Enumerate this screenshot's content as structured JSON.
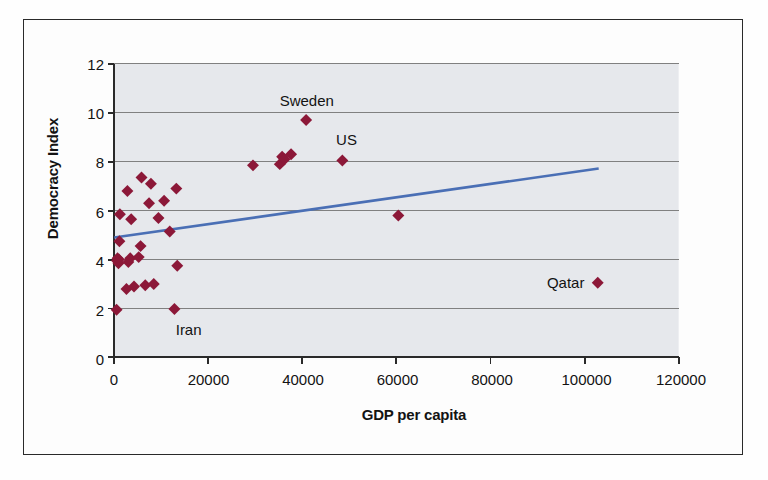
{
  "figure": {
    "name": "democracy-index-vs-gdp-scatter",
    "border_color": "#2a2a2a",
    "background": "#fdfdfd"
  },
  "chart_data": {
    "type": "scatter",
    "title": "",
    "subtitle": "",
    "xlabel": "GDP per capita",
    "ylabel": "Democracy Index",
    "xlim": [
      0,
      120000
    ],
    "ylim": [
      0,
      12
    ],
    "xticks": [
      0,
      20000,
      40000,
      60000,
      80000,
      100000,
      120000
    ],
    "xtick_labels": [
      "0",
      "20000",
      "40000",
      "60000",
      "80000",
      "100000",
      "120000"
    ],
    "yticks": [
      0,
      2,
      4,
      6,
      8,
      10,
      12
    ],
    "ytick_labels": [
      "0",
      "2",
      "4",
      "6",
      "8",
      "10",
      "12"
    ],
    "grid": "horizontal",
    "grid_color": "#808080",
    "plot_background": "#e6e8ec",
    "legend": "none",
    "marker": {
      "shape": "diamond",
      "color": "#8c1838",
      "size": 9
    },
    "series": [
      {
        "name": "Countries",
        "marker_color": "#8c1838",
        "points": [
          {
            "x": 500,
            "y": 1.95,
            "label": ""
          },
          {
            "x": 600,
            "y": 3.95,
            "label": ""
          },
          {
            "x": 700,
            "y": 4.05,
            "label": ""
          },
          {
            "x": 900,
            "y": 3.85,
            "label": ""
          },
          {
            "x": 1000,
            "y": 4.0,
            "label": ""
          },
          {
            "x": 1100,
            "y": 4.75,
            "label": ""
          },
          {
            "x": 1200,
            "y": 5.85,
            "label": ""
          },
          {
            "x": 2600,
            "y": 2.8,
            "label": ""
          },
          {
            "x": 2800,
            "y": 6.8,
            "label": ""
          },
          {
            "x": 3000,
            "y": 3.9,
            "label": ""
          },
          {
            "x": 3400,
            "y": 4.05,
            "label": ""
          },
          {
            "x": 3600,
            "y": 5.65,
            "label": ""
          },
          {
            "x": 4200,
            "y": 2.9,
            "label": ""
          },
          {
            "x": 5200,
            "y": 4.1,
            "label": ""
          },
          {
            "x": 5600,
            "y": 4.55,
            "label": ""
          },
          {
            "x": 5800,
            "y": 7.35,
            "label": ""
          },
          {
            "x": 6600,
            "y": 2.95,
            "label": ""
          },
          {
            "x": 7400,
            "y": 6.3,
            "label": ""
          },
          {
            "x": 7800,
            "y": 7.1,
            "label": ""
          },
          {
            "x": 8400,
            "y": 3.0,
            "label": ""
          },
          {
            "x": 9400,
            "y": 5.7,
            "label": ""
          },
          {
            "x": 10600,
            "y": 6.4,
            "label": ""
          },
          {
            "x": 11800,
            "y": 5.15,
            "label": ""
          },
          {
            "x": 12800,
            "y": 1.98,
            "label": "Iran"
          },
          {
            "x": 13200,
            "y": 6.9,
            "label": ""
          },
          {
            "x": 13400,
            "y": 3.75,
            "label": ""
          },
          {
            "x": 29500,
            "y": 7.85,
            "label": ""
          },
          {
            "x": 35200,
            "y": 7.9,
            "label": ""
          },
          {
            "x": 35700,
            "y": 8.2,
            "label": ""
          },
          {
            "x": 36200,
            "y": 8.1,
            "label": ""
          },
          {
            "x": 37600,
            "y": 8.3,
            "label": ""
          },
          {
            "x": 40800,
            "y": 9.7,
            "label": "Sweden"
          },
          {
            "x": 48500,
            "y": 8.05,
            "label": "US"
          },
          {
            "x": 60400,
            "y": 5.8,
            "label": ""
          },
          {
            "x": 102800,
            "y": 3.05,
            "label": "Qatar"
          }
        ]
      }
    ],
    "trendline": {
      "name": "linear-trend",
      "color": "#4a6fb5",
      "x_start": 0,
      "y_start": 4.9,
      "x_end": 103000,
      "y_end": 7.72
    },
    "annotations": [
      {
        "text": "Sweden",
        "x": 40800,
        "y": 10.45,
        "anchor": "center"
      },
      {
        "text": "US",
        "x": 49200,
        "y": 8.85,
        "anchor": "center"
      },
      {
        "text": "Iran",
        "x": 15800,
        "y": 1.15,
        "anchor": "center"
      },
      {
        "text": "Qatar",
        "x": 95600,
        "y": 3.05,
        "anchor": "center"
      }
    ]
  }
}
